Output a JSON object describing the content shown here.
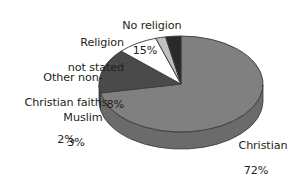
{
  "chart_data": {
    "type": "pie",
    "title": "",
    "subtitle": "",
    "xlabel": "",
    "ylabel": "",
    "legend_position": "none",
    "grid": false,
    "three_d": true,
    "start_angle_deg": 0,
    "direction": "clockwise",
    "units": "percent",
    "categories": [
      "Christian",
      "No religion",
      "Religion not stated",
      "Other non-Christian faiths",
      "Muslim"
    ],
    "values": [
      72,
      15,
      8,
      2,
      3
    ],
    "slices": [
      {
        "label": "Christian",
        "value": 72,
        "value_text": "72%",
        "color": "#808080",
        "side_color": "#6b6b6b"
      },
      {
        "label": "No religion",
        "value": 15,
        "value_text": "15%",
        "color": "#4a4a4a",
        "side_color": "#3d3d3d"
      },
      {
        "label": "Religion not stated",
        "value": 8,
        "value_text": "8%",
        "color": "#ffffff",
        "side_color": "#d8d8d8"
      },
      {
        "label": "Other non-Christian faiths",
        "value": 2,
        "value_text": "2%",
        "color": "#c0c0c0",
        "side_color": "#a5a5a5"
      },
      {
        "label": "Muslim",
        "value": 3,
        "value_text": "3%",
        "color": "#2a2a2a",
        "side_color": "#1f1f1f"
      }
    ]
  },
  "labels": {
    "no_religion": {
      "name": "No religion",
      "percent": "15%"
    },
    "religion_not_stated": {
      "line1": "Religion",
      "line2": "not stated",
      "percent": "8%"
    },
    "other_non_christian": {
      "line1": "Other non-",
      "line2": "Christian faiths",
      "percent": "2%"
    },
    "muslim": {
      "name": "Muslim",
      "percent": "3%"
    },
    "christian": {
      "name": "Christian",
      "percent": "72%"
    }
  },
  "colors": {
    "background": "#ffffff",
    "text": "#231f20",
    "outline": "#3a3a3a"
  }
}
